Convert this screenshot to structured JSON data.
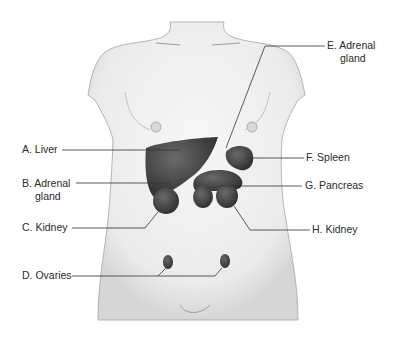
{
  "diagram": {
    "labels": [
      {
        "id": "A",
        "text": "A. Liver"
      },
      {
        "id": "B",
        "text": "B. Adrenal",
        "text2": "gland"
      },
      {
        "id": "C",
        "text": "C. Kidney"
      },
      {
        "id": "D",
        "text": "D. Ovaries"
      },
      {
        "id": "E",
        "text": "E. Adrenal",
        "text2": "gland"
      },
      {
        "id": "F",
        "text": "F. Spleen"
      },
      {
        "id": "G",
        "text": "G. Pancreas"
      },
      {
        "id": "H",
        "text": "H. Kidney"
      }
    ],
    "colors": {
      "skin": "#efefef",
      "outline": "#9a9a9a",
      "organ": "#4a4a4a",
      "line": "#333333",
      "text": "#2a2a2a"
    }
  }
}
